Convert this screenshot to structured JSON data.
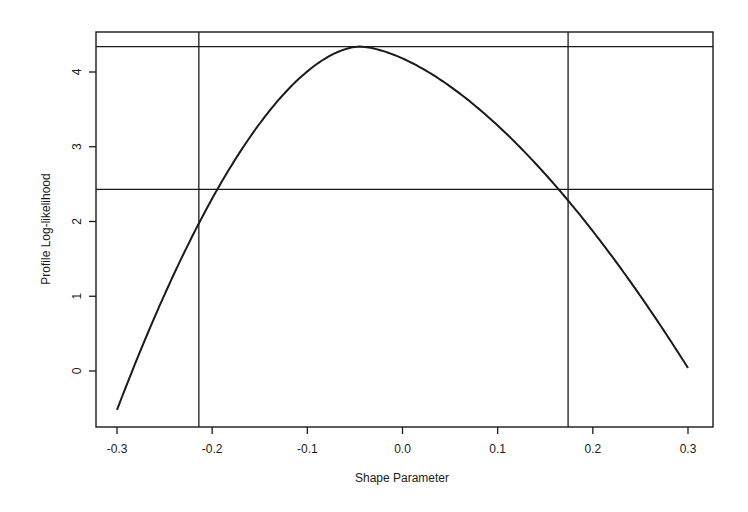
{
  "chart_data": {
    "type": "line",
    "title": "",
    "xlabel": "Shape Parameter",
    "ylabel": "Profile Log-likelihood",
    "xlim": [
      -0.322,
      0.326
    ],
    "ylim": [
      -0.75,
      4.54
    ],
    "grid": false,
    "x_ticks": [
      -0.3,
      -0.2,
      -0.1,
      0.0,
      0.1,
      0.2,
      0.3
    ],
    "x_tick_labels": [
      "-0.3",
      "-0.2",
      "-0.1",
      "0.0",
      "0.1",
      "0.2",
      "0.3"
    ],
    "y_ticks": [
      0,
      1,
      2,
      3,
      4
    ],
    "y_tick_labels": [
      "0",
      "1",
      "2",
      "3",
      "4"
    ],
    "series": [
      {
        "name": "profile log-likelihood",
        "x": [
          -0.3,
          -0.275,
          -0.25,
          -0.225,
          -0.2,
          -0.175,
          -0.15,
          -0.125,
          -0.1,
          -0.075,
          -0.05,
          -0.025,
          0.0,
          0.025,
          0.05,
          0.075,
          0.1,
          0.125,
          0.15,
          0.175,
          0.2,
          0.225,
          0.25,
          0.275,
          0.3
        ],
        "y": [
          -0.52,
          0.45,
          1.3,
          2.05,
          2.7,
          3.22,
          3.65,
          3.98,
          4.2,
          4.32,
          4.34,
          4.31,
          4.22,
          4.06,
          3.84,
          3.56,
          3.24,
          2.88,
          2.47,
          2.4,
          1.95,
          1.48,
          1.0,
          0.52,
          0.04
        ]
      }
    ],
    "reference_lines": {
      "horizontal": [
        {
          "label": "maximum log-likelihood",
          "y": 4.34
        },
        {
          "label": "confidence cutoff",
          "y": 2.43
        }
      ],
      "vertical": [
        {
          "label": "lower confidence limit",
          "x": -0.214
        },
        {
          "label": "upper confidence limit",
          "x": 0.174
        }
      ]
    },
    "annotations": []
  },
  "axes": {
    "xlabel": "Shape Parameter",
    "ylabel": "Profile Log-likelihood"
  },
  "colors": {
    "line": "#1a1a1a",
    "background": "#ffffff"
  }
}
